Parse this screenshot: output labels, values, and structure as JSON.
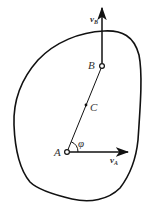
{
  "diagram": {
    "colors": {
      "stroke": "#111111",
      "label": "#333333",
      "background": "#ffffff"
    },
    "points": {
      "A": {
        "label": "A",
        "x": 67,
        "y": 152
      },
      "B": {
        "label": "B",
        "x": 102,
        "y": 66
      },
      "C": {
        "label": "C",
        "x": 86,
        "y": 105
      }
    },
    "vectors": {
      "vA": {
        "label": "v",
        "subscript": "A",
        "from": "A",
        "direction": "right"
      },
      "vB": {
        "label": "v",
        "subscript": "B",
        "from": "B",
        "direction": "up"
      }
    },
    "angle": {
      "label": "φ",
      "between": [
        "AB",
        "vA"
      ]
    }
  }
}
